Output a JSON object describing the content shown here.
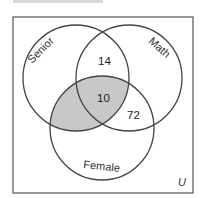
{
  "diagram": {
    "type": "venn",
    "universe_label": "U",
    "sets": [
      {
        "name": "Senior",
        "label": "Senior"
      },
      {
        "name": "Math",
        "label": "Math"
      },
      {
        "name": "Female",
        "label": "Female"
      }
    ],
    "regions": {
      "senior_math_only": "14",
      "senior_math_female": "10",
      "math_female_only": "72"
    },
    "shaded_region": "Senior ∩ Female",
    "colors": {
      "stroke": "#444444",
      "shade": "#c8c8c8",
      "background": "#ffffff"
    }
  }
}
